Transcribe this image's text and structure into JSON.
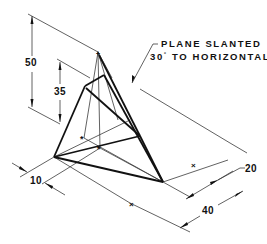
{
  "drawing": {
    "title": "Isometric pyramid with slanted cutting plane",
    "annotation": {
      "line1": "PLANE SLANTED",
      "line2_prefix": "30",
      "line2_degree": "°",
      "line2_suffix": " TO HORIZONTAL"
    },
    "dimensions": {
      "overall_height": "50",
      "cut_height": "35",
      "offset_left": "10",
      "offset_right": "20",
      "base_width": "40"
    },
    "colors": {
      "line": "#111111",
      "thin_line": "#3a3a3a",
      "background": "#ffffff"
    }
  }
}
